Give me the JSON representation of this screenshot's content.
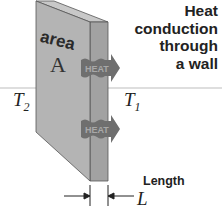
{
  "title": {
    "line1": "Heat",
    "line2": "conduction",
    "line3": "through",
    "line4": "a wall"
  },
  "wall": {
    "area_label": "area",
    "area_symbol": "A"
  },
  "heat_arrows": [
    {
      "label": "HEAT"
    },
    {
      "label": "HEAT"
    }
  ],
  "temperatures": {
    "left": {
      "symbol": "T",
      "subscript": "2"
    },
    "right": {
      "symbol": "T",
      "subscript": "1"
    }
  },
  "dimension": {
    "label": "Length",
    "symbol": "L"
  },
  "colors": {
    "wall_front": "#b4b4b4",
    "wall_side": "#a2a2a2",
    "wall_top": "#c8c8c8",
    "arrow": "#6f6f6f"
  }
}
